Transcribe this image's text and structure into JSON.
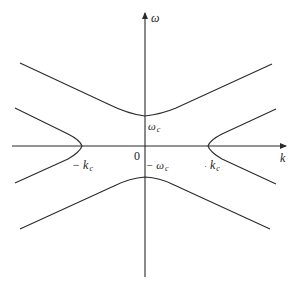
{
  "figure": {
    "axes": {
      "x_label": "k",
      "y_label": "ω",
      "origin_label": "0"
    },
    "labels": {
      "omega_c": {
        "symbol": "ω",
        "sub": "c"
      },
      "neg_omega_c": {
        "symbol": "− ω",
        "sub": "c"
      },
      "k_c": {
        "prefix": "·",
        "symbol": "k",
        "sub": "c"
      },
      "neg_k_c": {
        "symbol": "− k",
        "sub": "c"
      }
    },
    "curves": [
      {
        "name": "upper-hyperbola",
        "vertex_label": "ω_c",
        "opens": "up"
      },
      {
        "name": "lower-hyperbola",
        "vertex_label": "−ω_c",
        "opens": "down"
      },
      {
        "name": "left-hyperbola",
        "vertex_label": "−k_c",
        "opens": "left"
      },
      {
        "name": "right-hyperbola",
        "vertex_label": "k_c",
        "opens": "right"
      }
    ],
    "colors": {
      "line": "#2a2a2a",
      "background": "#ffffff"
    }
  }
}
